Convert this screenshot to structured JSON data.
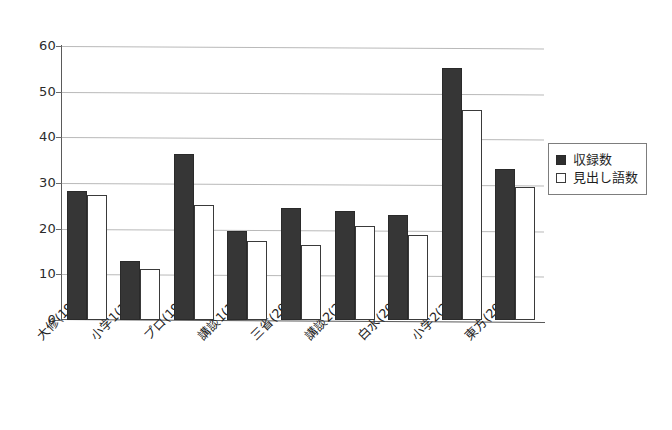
{
  "chart_data": {
    "type": "bar",
    "title": "",
    "subtitle": "",
    "xlabel": "",
    "ylabel": "",
    "ylim": [
      0,
      60
    ],
    "yticks": [
      0,
      10,
      20,
      30,
      40,
      50,
      60
    ],
    "grid": true,
    "legend_position": "right",
    "categories": [
      "大修(1987)",
      "小学1(1992)",
      "プロ(1998)",
      "講談1(1998)",
      "三省(2001)",
      "講談2(2002)",
      "白水(2002)",
      "小学2(2003)",
      "東方(2004)"
    ],
    "series": [
      {
        "name": "収録数",
        "color": "#363636",
        "style": "filled",
        "values": [
          28.2,
          13.0,
          36.4,
          19.5,
          24.6,
          23.8,
          22.9,
          55.2,
          33.1
        ]
      },
      {
        "name": "見出し語数",
        "color": "#ffffff",
        "style": "open",
        "values": [
          27.3,
          11.1,
          25.3,
          17.4,
          16.4,
          20.7,
          18.7,
          46.0,
          29.2
        ]
      }
    ]
  },
  "axis": {
    "y_tick_labels": [
      "60",
      "50",
      "40",
      "30",
      "20",
      "10",
      "0"
    ]
  },
  "legend": {
    "items": [
      {
        "label": "収録数",
        "style": "filled"
      },
      {
        "label": "見出し語数",
        "style": "open"
      }
    ]
  }
}
